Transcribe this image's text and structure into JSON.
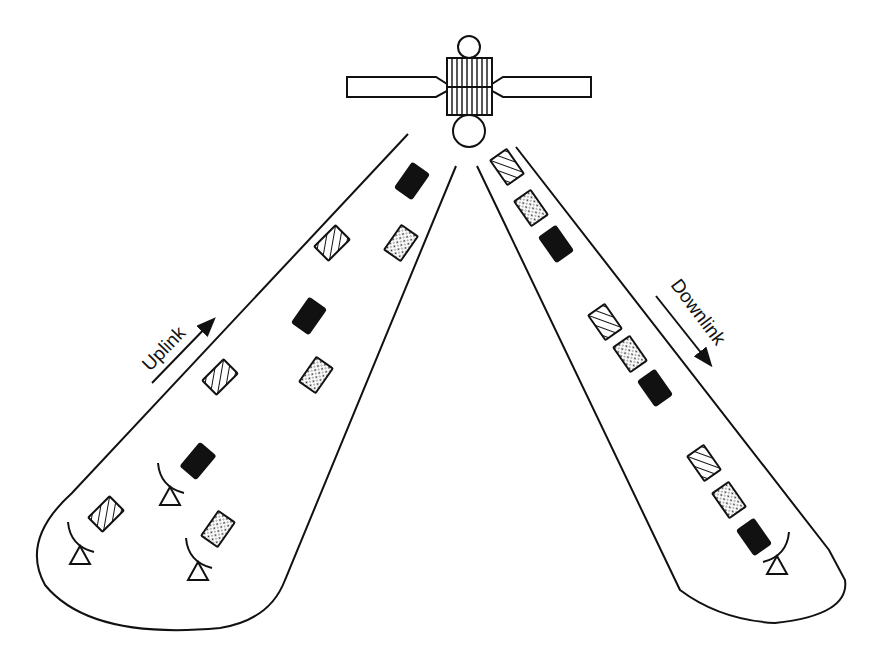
{
  "diagram": {
    "labels": {
      "uplink": "Uplink",
      "downlink": "Downlink"
    },
    "colors": {
      "ink": "#111111",
      "background": "#ffffff",
      "solid_packet": "#111111"
    },
    "satellite": {
      "parts": [
        "top-antenna-dish",
        "solar-panel-left",
        "body-grid",
        "solar-panel-right",
        "bottom-antenna-dish"
      ]
    },
    "packet_types": [
      "hatched",
      "dotted",
      "solid"
    ],
    "uplink_packets": [
      {
        "type": "solid",
        "x": 412,
        "y": 181
      },
      {
        "type": "dotted",
        "x": 401,
        "y": 243
      },
      {
        "type": "hatched",
        "x": 332,
        "y": 243
      },
      {
        "type": "solid",
        "x": 309,
        "y": 316
      },
      {
        "type": "dotted",
        "x": 316,
        "y": 375
      },
      {
        "type": "hatched",
        "x": 220,
        "y": 377
      },
      {
        "type": "solid",
        "x": 198,
        "y": 461
      },
      {
        "type": "dotted",
        "x": 218,
        "y": 529
      },
      {
        "type": "hatched",
        "x": 106,
        "y": 514
      }
    ],
    "downlink_packets": [
      {
        "type": "hatched",
        "x": 507,
        "y": 167
      },
      {
        "type": "dotted",
        "x": 531,
        "y": 208
      },
      {
        "type": "solid",
        "x": 556,
        "y": 244
      },
      {
        "type": "hatched",
        "x": 605,
        "y": 322
      },
      {
        "type": "dotted",
        "x": 630,
        "y": 354
      },
      {
        "type": "solid",
        "x": 655,
        "y": 388
      },
      {
        "type": "hatched",
        "x": 704,
        "y": 463
      },
      {
        "type": "dotted",
        "x": 729,
        "y": 500
      },
      {
        "type": "solid",
        "x": 754,
        "y": 537
      }
    ],
    "ground_stations": [
      {
        "beam": "uplink",
        "x": 80,
        "y": 560
      },
      {
        "beam": "uplink",
        "x": 170,
        "y": 500
      },
      {
        "beam": "uplink",
        "x": 197,
        "y": 570
      },
      {
        "beam": "downlink",
        "x": 775,
        "y": 565
      }
    ]
  }
}
